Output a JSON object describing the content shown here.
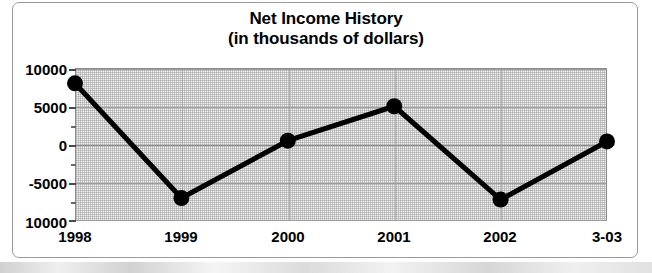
{
  "chart_data": {
    "type": "line",
    "title": "Net Income History",
    "subtitle": "(in thousands of dollars)",
    "xlabel": "",
    "ylabel": "",
    "categories": [
      "1998",
      "1999",
      "2000",
      "2001",
      "2002",
      "3-03"
    ],
    "values": [
      8000,
      -7000,
      500,
      5000,
      -7200,
      400
    ],
    "series": [
      {
        "name": "Net Income",
        "values": [
          8000,
          -7000,
          500,
          5000,
          -7200,
          400
        ]
      }
    ],
    "ylim": [
      -10000,
      10000
    ],
    "ytick_labels": [
      "10000",
      "5000",
      "0",
      "-5000",
      "10000"
    ],
    "ytick_values": [
      10000,
      5000,
      0,
      -5000,
      -10000
    ],
    "yminor_interval": 2500,
    "grid": true,
    "legend": "none",
    "marker": "filled-circle",
    "line_color": "#000000",
    "marker_color": "#000000",
    "plot_background": "#f0f0f0",
    "frame_color": "#9a9a9a"
  },
  "figure": {
    "title_line1": "Net Income History",
    "title_line2": "(in thousands of dollars)"
  }
}
